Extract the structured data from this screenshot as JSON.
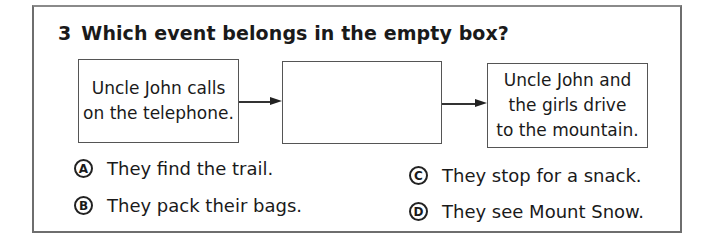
{
  "question": {
    "number": "3",
    "text": "Which event belongs in the empty box?"
  },
  "sequence": {
    "boxes": [
      {
        "text": "Uncle John calls on the telephone.",
        "lines": [
          "Uncle John calls",
          "on the telephone."
        ]
      },
      {
        "text": "",
        "lines": []
      },
      {
        "text": "Uncle John and the girls drive to the mountain.",
        "lines": [
          "Uncle John and",
          "the girls drive",
          "to the mountain."
        ]
      }
    ],
    "arrows": [
      {
        "from": 0,
        "to": 1
      },
      {
        "from": 1,
        "to": 2
      }
    ]
  },
  "options": [
    {
      "letter": "A",
      "text": "They find the trail."
    },
    {
      "letter": "B",
      "text": "They pack their bags."
    },
    {
      "letter": "C",
      "text": "They stop for a snack."
    },
    {
      "letter": "D",
      "text": "They see Mount Snow."
    }
  ]
}
